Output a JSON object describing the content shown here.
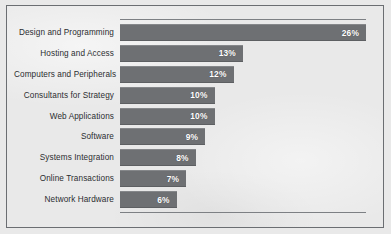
{
  "chart_data": {
    "type": "bar",
    "orientation": "horizontal",
    "title": "",
    "xlabel": "",
    "ylabel": "",
    "grid": false,
    "legend": "none",
    "xlim": [
      0,
      26
    ],
    "value_suffix": "%",
    "categories": [
      "Design and Programming",
      "Hosting and Access",
      "Computers and Peripherals",
      "Consultants for Strategy",
      "Web Applications",
      "Software",
      "Systems Integration",
      "Online Transactions",
      "Network Hardware"
    ],
    "values": [
      26,
      13,
      12,
      10,
      10,
      9,
      8,
      7,
      6
    ],
    "labels": [
      "26%",
      "13%",
      "12%",
      "10%",
      "10%",
      "9%",
      "8%",
      "7%",
      "6%"
    ],
    "colors": {
      "bar_fill": "#6e7073",
      "background": "#e9e9e9",
      "border": "#6b6e72",
      "axis_rule": "#7d8084",
      "value_text": "#ffffff",
      "category_text": "#2b2d30"
    }
  }
}
